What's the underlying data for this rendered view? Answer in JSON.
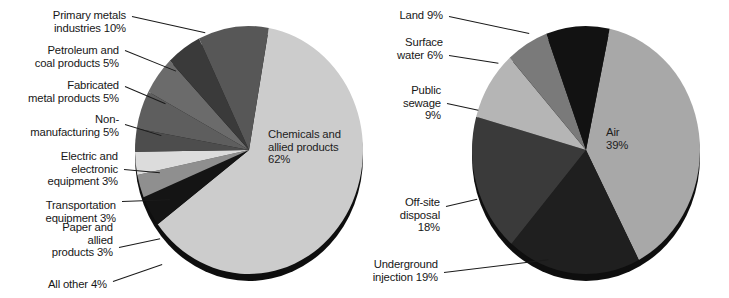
{
  "figure": {
    "title": "",
    "background": "#ffffff",
    "text_color": "#171717"
  },
  "chart_data": [
    {
      "type": "pie",
      "id": "industry-sources",
      "title": "",
      "center_label": "Chemicals and\nallied products\n62%",
      "legend_position": "callout-left",
      "start_angle_deg": -80,
      "direction": "clockwise",
      "categories": [
        "Chemicals and allied products",
        "All other",
        "Paper and allied products",
        "Transportation equipment",
        "Electric and electronic equipment",
        "Non-manufacturing",
        "Fabricated metal products",
        "Petroleum and coal products",
        "Primary metals industries"
      ],
      "values": [
        62,
        4,
        3,
        3,
        3,
        5,
        5,
        5,
        10
      ],
      "labels": [
        "Chemicals and allied products 62%",
        "All other 4%",
        "Paper and allied products 3%",
        "Transportation equipment 3%",
        "Electric and electronic equipment 3%",
        "Non-manufacturing 5%",
        "Fabricated metal products 5%",
        "Petroleum and coal products 5%",
        "Primary metals industries 10%"
      ],
      "colors": [
        "#cccccc",
        "#141414",
        "#8f8f8f",
        "#dcdcdc",
        "#4d4d4d",
        "#5e5e5e",
        "#6b6b6b",
        "#3a3a3a",
        "#575757"
      ],
      "callouts": [
        {
          "name": "primary-metals",
          "lines": [
            "Primary metals",
            "industries 10%"
          ],
          "align": "right",
          "x": 22,
          "y": 9,
          "lead_x": 132,
          "lead_y": 16,
          "lead_len": 75,
          "lead_angle": 12.5
        },
        {
          "name": "petroleum-coal",
          "lines": [
            "Petroleum and",
            "coal products 5%"
          ],
          "align": "right",
          "x": 26,
          "y": 44,
          "lead_x": 125,
          "lead_y": 50,
          "lead_len": 55,
          "lead_angle": 22
        },
        {
          "name": "fabricated-metal",
          "lines": [
            "Fabricated",
            "metal products 5%"
          ],
          "align": "right",
          "x": 16,
          "y": 79,
          "lead_x": 125,
          "lead_y": 86,
          "lead_len": 44,
          "lead_angle": 23
        },
        {
          "name": "non-manufacturing",
          "lines": [
            "Non-",
            "manufacturing 5%"
          ],
          "align": "right",
          "x": 16,
          "y": 113,
          "lead_x": 125,
          "lead_y": 124,
          "lead_len": 38,
          "lead_angle": 17
        },
        {
          "name": "electric-electronic",
          "lines": [
            "Electric and",
            "electronic",
            "equipment 3%"
          ],
          "align": "right",
          "x": 24,
          "y": 150,
          "lead_x": 124,
          "lead_y": 169,
          "lead_len": 36,
          "lead_angle": 5
        },
        {
          "name": "transportation-equip",
          "lines": [
            "Transportation",
            "equipment 3%"
          ],
          "align": "right",
          "x": 16,
          "y": 199,
          "lead_x": 122,
          "lead_y": 201,
          "lead_len": 48,
          "lead_angle": -2
        },
        {
          "name": "paper-allied",
          "lines": [
            "Paper and",
            "allied",
            "products 3%"
          ],
          "align": "right",
          "x": 32,
          "y": 221,
          "lead_x": 119,
          "lead_y": 247,
          "lead_len": 42,
          "lead_angle": -12
        },
        {
          "name": "all-other",
          "lines": [
            "All other 4%"
          ],
          "align": "right",
          "x": 28,
          "y": 278,
          "lead_x": 113,
          "lead_y": 281,
          "lead_len": 52,
          "lead_angle": -19
        }
      ]
    },
    {
      "type": "pie",
      "id": "release-destinations",
      "title": "",
      "center_label": "Air\n39%",
      "legend_position": "callout-left",
      "start_angle_deg": -78,
      "direction": "clockwise",
      "categories": [
        "Air",
        "Underground injection",
        "Off-site disposal",
        "Public sewage",
        "Surface water",
        "Land"
      ],
      "values": [
        39,
        19,
        18,
        9,
        6,
        9
      ],
      "labels": [
        "Air 39%",
        "Underground injection 19%",
        "Off-site disposal 18%",
        "Public sewage 9%",
        "Surface water 6%",
        "Land 9%"
      ],
      "colors": [
        "#a8a8a8",
        "#1f1f1f",
        "#3a3a3a",
        "#b5b5b5",
        "#7a7a7a",
        "#121212"
      ],
      "callouts": [
        {
          "name": "land",
          "lines": [
            "Land 9%"
          ],
          "align": "right",
          "x": 20,
          "y": 9,
          "lead_x": 90,
          "lead_y": 16,
          "lead_len": 82,
          "lead_angle": 12
        },
        {
          "name": "surface-water",
          "lines": [
            "Surface",
            "water 6%"
          ],
          "align": "right",
          "x": 20,
          "y": 36,
          "lead_x": 90,
          "lead_y": 55,
          "lead_len": 50,
          "lead_angle": 9
        },
        {
          "name": "public-sewage",
          "lines": [
            "Public",
            "sewage",
            "9%"
          ],
          "align": "right",
          "x": 26,
          "y": 84,
          "lead_x": 88,
          "lead_y": 103,
          "lead_len": 32,
          "lead_angle": 12
        },
        {
          "name": "off-site-disposal",
          "lines": [
            "Off-site",
            "disposal",
            "18%"
          ],
          "align": "right",
          "x": 22,
          "y": 196,
          "lead_x": 87,
          "lead_y": 206,
          "lead_len": 32,
          "lead_angle": -13
        },
        {
          "name": "underground-injection",
          "lines": [
            "Underground",
            "injection 19%"
          ],
          "align": "right",
          "x": 6,
          "y": 258,
          "lead_x": 85,
          "lead_y": 272,
          "lead_len": 105,
          "lead_angle": -7
        }
      ]
    }
  ]
}
